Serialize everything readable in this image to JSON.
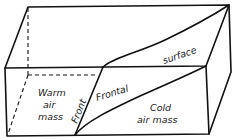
{
  "diagram": {
    "labels": {
      "warm_line1": "Warm",
      "warm_line2": "air",
      "warm_line3": "mass",
      "front": "Front",
      "frontal": "Frontal",
      "surface": "surface",
      "cold_line1": "Cold",
      "cold_line2": "air mass"
    },
    "colors": {
      "line": "#111111",
      "background": "#ffffff"
    }
  }
}
